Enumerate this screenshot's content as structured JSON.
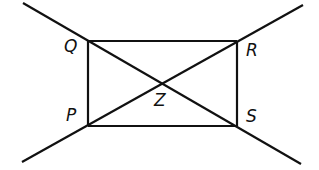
{
  "diagram": {
    "type": "geometry-figure",
    "stroke_color": "#111111",
    "background": "#ffffff",
    "points": {
      "Q": {
        "label": "Q",
        "x": 88,
        "y": 41
      },
      "R": {
        "label": "R",
        "x": 237,
        "y": 41
      },
      "S": {
        "label": "S",
        "x": 237,
        "y": 126
      },
      "P": {
        "label": "P",
        "x": 88,
        "y": 126
      },
      "Z": {
        "label": "Z",
        "x": 162,
        "y": 83
      }
    },
    "segments": [
      {
        "name": "QR",
        "from": "Q",
        "to": "R"
      },
      {
        "name": "RS",
        "from": "R",
        "to": "S"
      },
      {
        "name": "SP",
        "from": "S",
        "to": "P"
      },
      {
        "name": "PQ",
        "from": "P",
        "to": "Q"
      }
    ],
    "lines": [
      {
        "name": "line-QS",
        "through": [
          "Q",
          "Z",
          "S"
        ],
        "x1": 23,
        "y1": 3,
        "x2": 301,
        "y2": 164
      },
      {
        "name": "line-PR",
        "through": [
          "P",
          "Z",
          "R"
        ],
        "x1": 22,
        "y1": 162,
        "x2": 303,
        "y2": 5
      }
    ],
    "labels": {
      "Q": "Q",
      "R": "R",
      "S": "S",
      "P": "P",
      "Z": "Z"
    }
  }
}
